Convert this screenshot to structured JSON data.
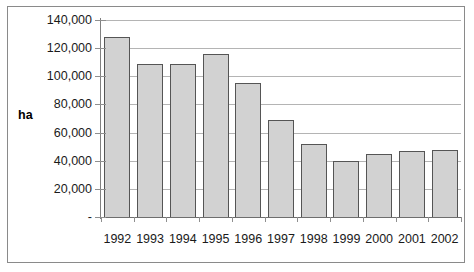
{
  "chart_data": {
    "type": "bar",
    "title": "",
    "subtitle": "",
    "xlabel": "",
    "ylabel": "ha",
    "categories": [
      "1992",
      "1993",
      "1994",
      "1995",
      "1996",
      "1997",
      "1998",
      "1999",
      "2000",
      "2001",
      "2002"
    ],
    "values": [
      128000,
      108500,
      108500,
      116000,
      95000,
      69000,
      52000,
      40000,
      44500,
      47000,
      47500
    ],
    "ylim": [
      0,
      140000
    ],
    "ytick_values": [
      0,
      20000,
      40000,
      60000,
      80000,
      100000,
      120000,
      140000
    ],
    "ytick_labels": [
      "-",
      "20,000",
      "40,000",
      "60,000",
      "80,000",
      "100,000",
      "120,000",
      "140,000"
    ],
    "grid": true,
    "grid_axis": "y",
    "legend": "none",
    "series": [
      {
        "name": "ha",
        "values": [
          128000,
          108500,
          108500,
          116000,
          95000,
          69000,
          52000,
          40000,
          44500,
          47000,
          47500
        ]
      }
    ],
    "colors": {
      "bar_fill": "#d2d2d2",
      "bar_border": "#555555",
      "gridline": "#b4b4b4",
      "axis": "#808080",
      "text": "#1a1a1a",
      "frame": "#8a8a8a",
      "background": "#ffffff"
    }
  }
}
